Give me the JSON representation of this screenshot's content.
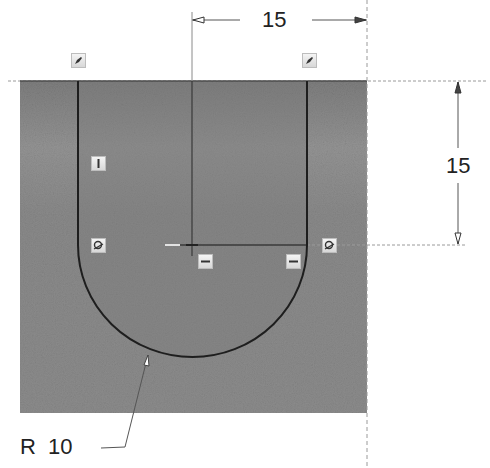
{
  "sketch": {
    "background_color": "#ffffff",
    "region_color": "#8a8a8a",
    "profile_color": "#1e1e1e",
    "dimension_color": "#333333"
  },
  "dimensions": {
    "horizontal": {
      "label": "15",
      "orientation": "horizontal"
    },
    "vertical": {
      "label": "15",
      "orientation": "vertical"
    },
    "radius": {
      "label": "R  10",
      "orientation": "leader"
    }
  },
  "constraints": [
    {
      "id": "tangent-top-left",
      "icon": "coincident-icon",
      "type": "coincident"
    },
    {
      "id": "tangent-top-right",
      "icon": "coincident-icon",
      "type": "coincident"
    },
    {
      "id": "vertical-left",
      "icon": "vertical-icon",
      "type": "vertical"
    },
    {
      "id": "tangent-left",
      "icon": "tangent-icon",
      "type": "tangent"
    },
    {
      "id": "tangent-right",
      "icon": "tangent-icon",
      "type": "tangent"
    },
    {
      "id": "horizontal-center",
      "icon": "horizontal-icon",
      "type": "horizontal"
    },
    {
      "id": "horizontal-right",
      "icon": "horizontal-icon",
      "type": "horizontal"
    }
  ]
}
